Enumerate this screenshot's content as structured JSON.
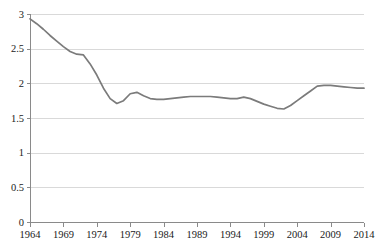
{
  "chart_data": {
    "type": "line",
    "title": "",
    "subtitle": "",
    "xlabel": "",
    "ylabel": "",
    "xlim": [
      1964,
      2014
    ],
    "ylim": [
      0,
      3
    ],
    "grid": true,
    "legend": false,
    "legend_position": "none",
    "line_color": "#7b7b7b",
    "gridline_color": "#d0d0d0",
    "axis_color": "#8a8a8a",
    "y_ticks": [
      "0",
      "0.5",
      "1",
      "1.5",
      "2",
      "2.5",
      "3"
    ],
    "y_tick_values": [
      0,
      0.5,
      1,
      1.5,
      2,
      2.5,
      3
    ],
    "x_ticks": [
      "1964",
      "1969",
      "1974",
      "1979",
      "1984",
      "1989",
      "1994",
      "1999",
      "2004",
      "2009",
      "2014"
    ],
    "x_tick_values": [
      1964,
      1969,
      1974,
      1979,
      1984,
      1989,
      1994,
      1999,
      2004,
      2009,
      2014
    ],
    "series": [
      {
        "name": "Series 1",
        "color": "#7b7b7b",
        "x": [
          1964,
          1965,
          1966,
          1967,
          1968,
          1969,
          1970,
          1971,
          1972,
          1973,
          1974,
          1975,
          1976,
          1977,
          1978,
          1979,
          1980,
          1981,
          1982,
          1983,
          1984,
          1985,
          1986,
          1987,
          1988,
          1989,
          1990,
          1991,
          1992,
          1993,
          1994,
          1995,
          1996,
          1997,
          1998,
          1999,
          2000,
          2001,
          2002,
          2003,
          2004,
          2005,
          2006,
          2007,
          2008,
          2009,
          2010,
          2011,
          2012,
          2013,
          2014
        ],
        "values": [
          2.93,
          2.86,
          2.78,
          2.69,
          2.61,
          2.53,
          2.46,
          2.42,
          2.41,
          2.28,
          2.12,
          1.93,
          1.78,
          1.71,
          1.75,
          1.85,
          1.87,
          1.82,
          1.78,
          1.77,
          1.77,
          1.78,
          1.79,
          1.8,
          1.81,
          1.81,
          1.81,
          1.81,
          1.8,
          1.79,
          1.78,
          1.78,
          1.8,
          1.78,
          1.74,
          1.7,
          1.67,
          1.64,
          1.63,
          1.68,
          1.75,
          1.82,
          1.89,
          1.96,
          1.97,
          1.97,
          1.96,
          1.95,
          1.94,
          1.93,
          1.93
        ]
      }
    ]
  },
  "watermark": {
    "line1": "",
    "line2": ""
  }
}
